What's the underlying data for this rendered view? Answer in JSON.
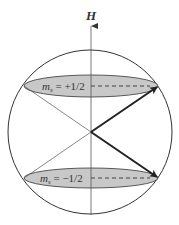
{
  "diagram": {
    "axis_label": "H",
    "states": [
      {
        "label_symbol": "m",
        "label_subscript": "s",
        "label_value": " = +1/2"
      },
      {
        "label_symbol": "m",
        "label_subscript": "s",
        "label_value": " = −1/2"
      }
    ],
    "colors": {
      "stroke": "#333333",
      "ellipse_fill": "#c8c8c8",
      "arrow": "#222222",
      "background": "#ffffff"
    }
  }
}
